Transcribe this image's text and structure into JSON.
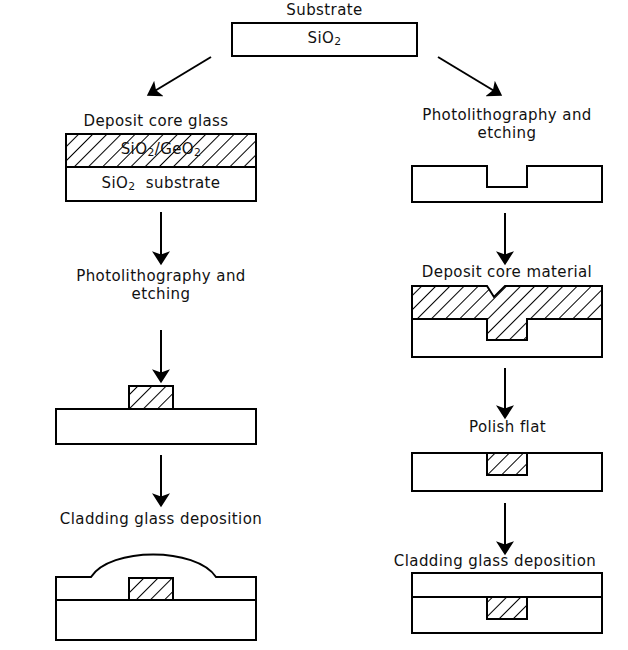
{
  "diagram": {
    "title_top": "Substrate",
    "substrate_box_label": "SiO2",
    "left_branch": {
      "step1_label": "Deposit core glass",
      "step1_core_layer": "SiO2/GeO2",
      "step1_substrate_layer": "SiO2  substrate",
      "step2_label": "Photolithography and\netching",
      "step3_label": "Cladding glass deposition"
    },
    "right_branch": {
      "step1_label": "Photolithography and\netching",
      "step2_label": "Deposit core material",
      "step3_label": "Polish flat",
      "step4_label": "Cladding glass deposition"
    }
  },
  "colors": {
    "stroke": "#000000",
    "background": "#ffffff",
    "text": "#111111"
  }
}
